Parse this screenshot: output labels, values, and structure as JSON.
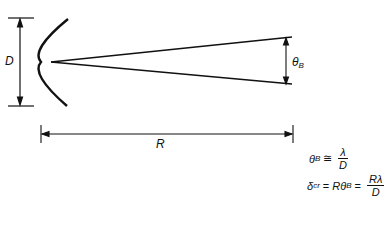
{
  "diagram": {
    "labels": {
      "aperture_diameter": "D",
      "range": "R",
      "beamwidth_symbol": "θ",
      "beamwidth_subscript": "B"
    },
    "equations": {
      "beamwidth": {
        "lhs_symbol": "θ",
        "lhs_subscript": "B",
        "operator": "≅",
        "numerator": "λ",
        "denominator": "D"
      },
      "cross_range_resolution": {
        "lhs_symbol": "δ",
        "lhs_subscript": "cr",
        "operator1": "=",
        "middle": "Rθ",
        "middle_subscript": "B",
        "operator2": "=",
        "numerator": "Rλ",
        "denominator": "D"
      }
    },
    "colors": {
      "stroke": "#111111",
      "background": "#ffffff"
    }
  }
}
